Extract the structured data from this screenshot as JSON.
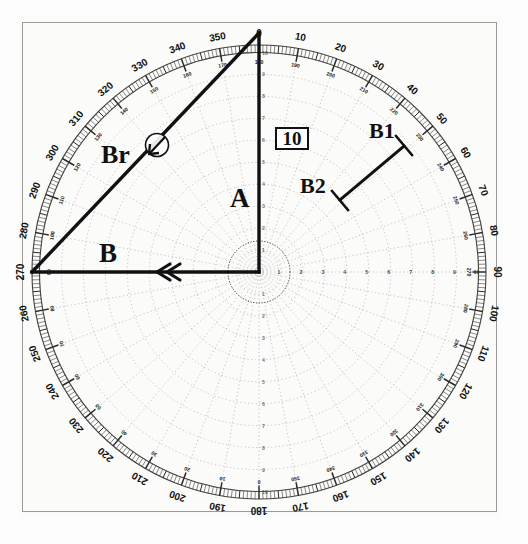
{
  "document": {
    "title": "Maneuvering Board Relative Motion Plot",
    "sheet_type": "polar-plotting-sheet"
  },
  "colors": {
    "paper": "#fbfbfa",
    "ink": "#111111",
    "grid": "#8d8d8d",
    "frame": "#9a9a9a",
    "ring": "#555555"
  },
  "scale_box": {
    "label": "10",
    "name": "scale-value"
  },
  "vector_labels": {
    "a": "A",
    "b": "B",
    "br": "Br",
    "b1": "B1",
    "b2": "B2"
  },
  "compass": {
    "outer_major_labels": [
      0,
      10,
      20,
      30,
      40,
      50,
      60,
      70,
      80,
      90,
      100,
      110,
      120,
      130,
      140,
      150,
      160,
      170,
      180,
      190,
      200,
      210,
      220,
      230,
      240,
      250,
      260,
      270,
      280,
      290,
      300,
      310,
      320,
      330,
      340,
      350
    ],
    "inner_reciprocal_labels": [
      180,
      190,
      200,
      210,
      220,
      230,
      240,
      250,
      260,
      270,
      280,
      290,
      300,
      310,
      320,
      330,
      340,
      350,
      0,
      10,
      20,
      30,
      40,
      50,
      60,
      70,
      80,
      90,
      100,
      110,
      120,
      130,
      140,
      150,
      160,
      170
    ],
    "minor_tick_degrees": 1,
    "major_tick_degrees": 10,
    "intermediate_tick_degrees": 5
  },
  "polar_grid": {
    "center_px": [
      259,
      272
    ],
    "outer_radius_px": 227,
    "range_rings": [
      1,
      2,
      3,
      4,
      5,
      6,
      7,
      8,
      9,
      10
    ],
    "ring_labels_on_axis": [
      "1",
      "2",
      "3",
      "4",
      "5",
      "6",
      "7",
      "8",
      "9",
      "10"
    ],
    "radial_spokes_degrees": 10,
    "inner_circle_radius_px": 31
  },
  "chart_data": {
    "type": "scatter",
    "xlabel": "",
    "ylabel": "",
    "coordinate_system": "polar",
    "angular_unit": "degrees",
    "angular_range": [
      0,
      360
    ],
    "radial_range": [
      0,
      10
    ],
    "radial_label": "10",
    "gridlines": true,
    "legend": "none",
    "vectors": [
      {
        "name": "A",
        "label": "A",
        "description": "own ship true vector, drawn from center upward to 000 degrees",
        "from_polar": {
          "bearing": 0,
          "range": 0
        },
        "to_polar": {
          "bearing": 0,
          "range": 10
        },
        "from_px": [
          259,
          272
        ],
        "to_px": [
          259,
          33
        ],
        "style": "solid-thick"
      },
      {
        "name": "B",
        "label": "B",
        "description": "other ship true vector, horizontal from center to 270 degrees, double chevron arrowhead pointing left",
        "from_polar": {
          "bearing": 270,
          "range": 0
        },
        "to_polar": {
          "bearing": 270,
          "range": 10
        },
        "from_px": [
          259,
          272
        ],
        "to_px": [
          32,
          272
        ],
        "style": "solid-thick",
        "arrowhead": "double-chevron-left"
      },
      {
        "name": "Br",
        "label": "Br",
        "description": "relative vector, hypotenuse from 270/10 to 000/10, circled single arrow marker indicating direction",
        "from_px": [
          32,
          272
        ],
        "to_px": [
          259,
          33
        ],
        "style": "solid-thick",
        "marker": "circled-arrow",
        "marker_px": [
          156,
          145
        ],
        "marker_radius_px": 11
      },
      {
        "name": "B1-B2",
        "label_start": "B1",
        "label_end": "B2",
        "description": "short plotted segment with perpendicular end ticks in the 045 sector",
        "from_px": [
          404,
          146
        ],
        "to_px": [
          340,
          200
        ],
        "style": "solid-thick",
        "end_ticks": true
      }
    ],
    "annotations": [
      {
        "text": "10",
        "type": "scale-box",
        "px": [
          275,
          127
        ]
      },
      {
        "text": "A",
        "px": [
          230,
          185
        ]
      },
      {
        "text": "B",
        "px": [
          99,
          240
        ]
      },
      {
        "text": "Br",
        "px": [
          101,
          142
        ]
      },
      {
        "text": "B1",
        "px": [
          369,
          120
        ]
      },
      {
        "text": "B2",
        "px": [
          300,
          175
        ]
      }
    ]
  }
}
